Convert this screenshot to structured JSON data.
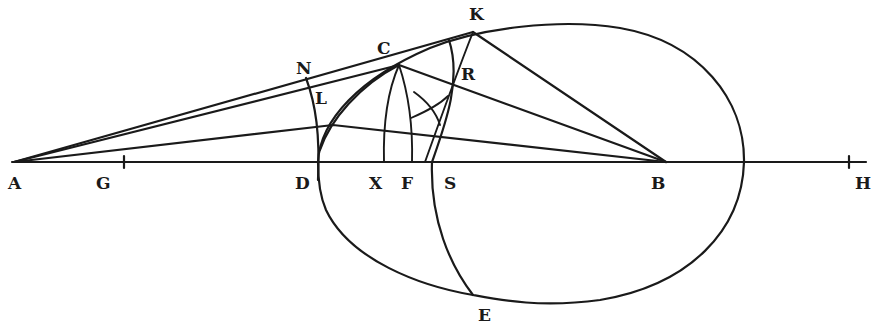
{
  "diagram": {
    "type": "geometric-construction",
    "ink_color": "#1a1a1a",
    "background": "#ffffff",
    "points": [
      {
        "id": "A",
        "label": "A",
        "x": 14,
        "y": 162,
        "label_x": 8,
        "label_y": 189
      },
      {
        "id": "G",
        "label": "G",
        "x": 124,
        "y": 162,
        "label_x": 96,
        "label_y": 189
      },
      {
        "id": "D",
        "label": "D",
        "x": 318,
        "y": 162,
        "label_x": 295,
        "label_y": 189
      },
      {
        "id": "X",
        "label": "X",
        "x": 384,
        "y": 162,
        "label_x": 369,
        "label_y": 189
      },
      {
        "id": "F",
        "label": "F",
        "x": 412,
        "y": 162,
        "label_x": 401,
        "label_y": 189
      },
      {
        "id": "S",
        "label": "S",
        "x": 432,
        "y": 162,
        "label_x": 444,
        "label_y": 189
      },
      {
        "id": "B",
        "label": "B",
        "x": 666,
        "y": 162,
        "label_x": 651,
        "label_y": 189
      },
      {
        "id": "H",
        "label": "H",
        "x": 849,
        "y": 162,
        "label_x": 855,
        "label_y": 189
      },
      {
        "id": "C",
        "label": "C",
        "x": 399,
        "y": 65,
        "label_x": 377,
        "label_y": 54
      },
      {
        "id": "K",
        "label": "K",
        "x": 473,
        "y": 32,
        "label_x": 469,
        "label_y": 20
      },
      {
        "id": "N",
        "label": "N",
        "x": 306,
        "y": 78,
        "label_x": 296,
        "label_y": 74
      },
      {
        "id": "L",
        "label": "L",
        "x": 320,
        "y": 107,
        "label_x": 315,
        "label_y": 104
      },
      {
        "id": "R",
        "label": "R",
        "x": 447,
        "y": 90,
        "label_x": 461,
        "label_y": 80
      },
      {
        "id": "E",
        "label": "E",
        "x": 473,
        "y": 295,
        "label_x": 478,
        "label_y": 321
      }
    ],
    "labels": [
      "A",
      "G",
      "D",
      "X",
      "F",
      "S",
      "B",
      "H",
      "C",
      "K",
      "N",
      "L",
      "R",
      "E"
    ],
    "elements": [
      "axis line AH",
      "oval curve through D, K, E",
      "line AK (tangent)",
      "line AC",
      "line A to point near L extended to B",
      "line CB",
      "line KB",
      "arc N-D",
      "arc C-D",
      "arc C-X",
      "arc C-F",
      "arc K-S-E",
      "arc through R crossing",
      "small cross-mark near R"
    ]
  }
}
